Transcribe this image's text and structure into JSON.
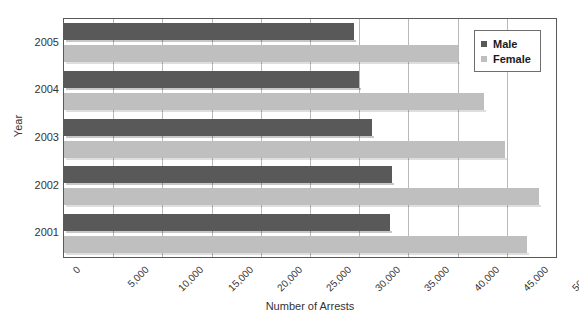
{
  "chart_data": {
    "type": "bar",
    "orientation": "horizontal",
    "title": "",
    "xlabel": "Number of Arrests",
    "ylabel": "Year",
    "categories": [
      "2005",
      "2004",
      "2003",
      "2002",
      "2001"
    ],
    "series": [
      {
        "name": "Male",
        "color": "#595959",
        "values": [
          29500,
          30000,
          31300,
          33300,
          33100
        ]
      },
      {
        "name": "Female",
        "color": "#bfbfbf",
        "values": [
          40000,
          42700,
          44800,
          48300,
          47100
        ]
      }
    ],
    "xlim": [
      0,
      50000
    ],
    "xticks": [
      0,
      5000,
      10000,
      15000,
      20000,
      25000,
      30000,
      35000,
      40000,
      45000,
      50000
    ],
    "xtick_labels": [
      "0",
      "5,000",
      "10,000",
      "15,000",
      "20,000",
      "25,000",
      "30,000",
      "35,000",
      "40,000",
      "45,000",
      "50,000"
    ],
    "grid": "vertical",
    "legend_position": "top-right"
  },
  "legend": {
    "entries": [
      {
        "label": "Male",
        "color": "#595959"
      },
      {
        "label": "Female",
        "color": "#bfbfbf"
      }
    ]
  }
}
